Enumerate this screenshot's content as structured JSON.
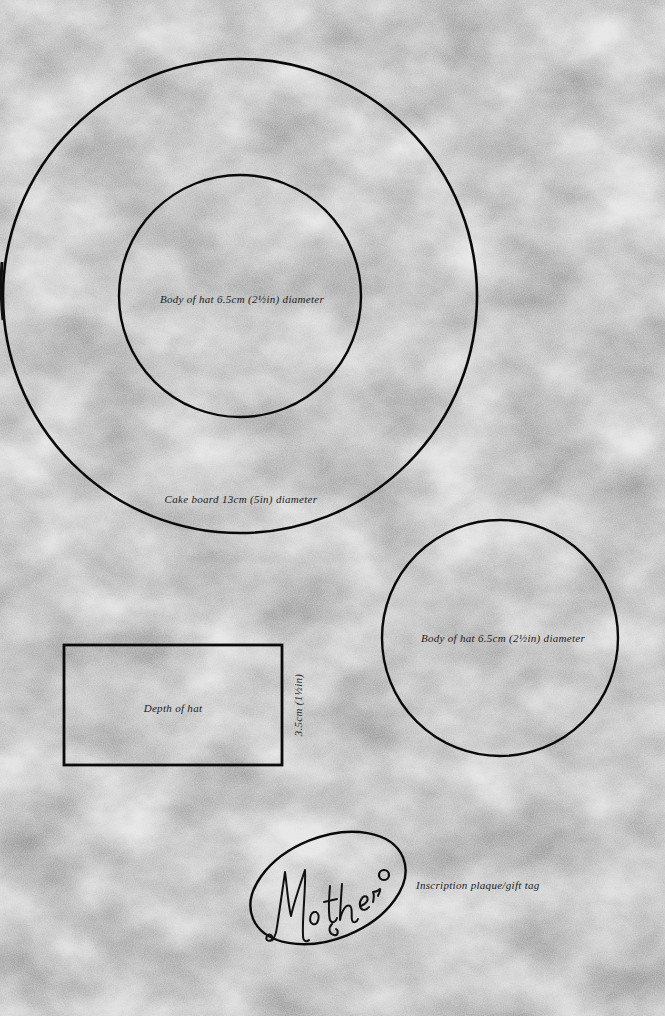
{
  "page": {
    "background_color": "#d8d8d8",
    "line_color": "#0a0a0a"
  },
  "templates": {
    "cake_board": {
      "label": "Cake board 13cm (5in) diameter",
      "shape": "circle",
      "center": [
        240,
        296
      ],
      "radius": 237
    },
    "hat_body_inner": {
      "label": "Body of hat 6.5cm (2½in) diameter",
      "shape": "circle",
      "center": [
        240,
        296
      ],
      "radius": 121
    },
    "hat_body_separate": {
      "label": "Body of hat 6.5cm (2½in) diameter",
      "shape": "circle",
      "center": [
        500,
        638
      ],
      "radius": 118
    },
    "hat_depth": {
      "label": "Depth of hat",
      "dimension_label": "3.5cm (1½in)",
      "shape": "rectangle",
      "x": 64,
      "y": 645,
      "width": 218,
      "height": 120
    },
    "plaque": {
      "inscription": "Mother",
      "label": "Inscription plaque/gift tag",
      "shape": "ellipse",
      "center": [
        328,
        888
      ],
      "rx": 81,
      "ry": 51,
      "rotation": -22,
      "hole": {
        "center": [
          384,
          875
        ],
        "radius": 5
      }
    }
  }
}
